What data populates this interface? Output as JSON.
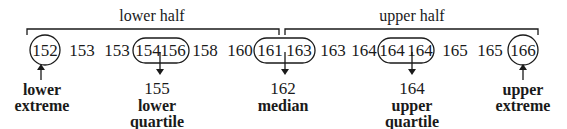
{
  "halves": {
    "lower": "lower half",
    "upper": "upper half"
  },
  "values": [
    "152",
    "153",
    "153",
    "154",
    "156",
    "158",
    "160",
    "161",
    "163",
    "163",
    "164",
    "164",
    "164",
    "165",
    "165",
    "166"
  ],
  "annotations": {
    "lower_extreme": {
      "value": "",
      "line1": "lower",
      "line2": "extreme"
    },
    "lower_quartile": {
      "value": "155",
      "line1": "lower",
      "line2": "quartile"
    },
    "median": {
      "value": "162",
      "line1": "median",
      "line2": ""
    },
    "upper_quartile": {
      "value": "164",
      "line1": "upper",
      "line2": "quartile"
    },
    "upper_extreme": {
      "value": "",
      "line1": "upper",
      "line2": "extreme"
    }
  }
}
